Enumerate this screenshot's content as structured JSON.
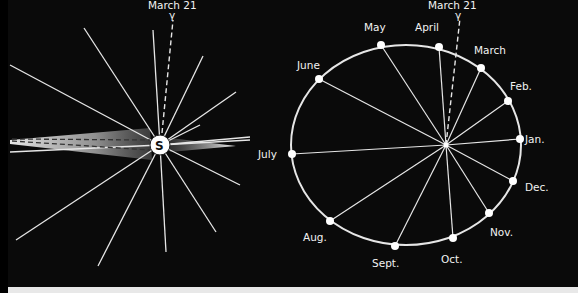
{
  "left_diagram": {
    "equinox_label": "March 21",
    "equinox_symbol": "γ",
    "sun_label": "S",
    "ray_count": 16
  },
  "right_diagram": {
    "equinox_label": "March 21",
    "equinox_symbol": "γ",
    "months": [
      {
        "key": "jan",
        "label": "Jan."
      },
      {
        "key": "feb",
        "label": "Feb."
      },
      {
        "key": "march",
        "label": "March"
      },
      {
        "key": "april",
        "label": "April"
      },
      {
        "key": "may",
        "label": "May"
      },
      {
        "key": "june",
        "label": "June"
      },
      {
        "key": "july",
        "label": "July"
      },
      {
        "key": "aug",
        "label": "Aug."
      },
      {
        "key": "sept",
        "label": "Sept."
      },
      {
        "key": "oct",
        "label": "Oct."
      },
      {
        "key": "nov",
        "label": "Nov."
      },
      {
        "key": "dec",
        "label": "Dec."
      }
    ]
  },
  "colors": {
    "background": "#0a0a0a",
    "line": "#e6e6e6",
    "text": "#f2f2f2"
  }
}
